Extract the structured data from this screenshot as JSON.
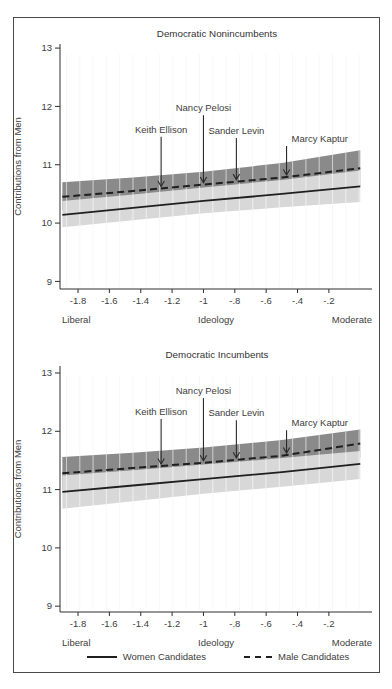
{
  "figure": {
    "background": "#ffffff",
    "border_color": "#4a4a4a",
    "text_color": "#3d3d3d",
    "line_color": "#1f1f1f",
    "band_colors": {
      "male": "#8a8a8a",
      "women": "#d8d8d8"
    },
    "legend": {
      "items": [
        {
          "label": "Women Candidates",
          "style": "solid"
        },
        {
          "label": "Male Candidates",
          "style": "dashed"
        }
      ]
    }
  },
  "chart_data": [
    {
      "type": "area",
      "title": "Democratic Nonincumbents",
      "xlabel": "Ideology",
      "ylabel": "Contributions from Men",
      "x_axis_end_labels": {
        "left": "Liberal",
        "right": "Moderate"
      },
      "xlim": [
        -1.915,
        0.075
      ],
      "ylim": [
        8.87,
        13.07
      ],
      "x_ticks": {
        "values": [
          -1.8,
          -1.6,
          -1.4,
          -1.2,
          -1.0,
          -0.8,
          -0.6,
          -0.4,
          -0.2
        ],
        "labels": [
          "-1.8",
          "-1.6",
          "-1.4",
          "-1.2",
          "-1",
          "-.8",
          "-.6",
          "-.4",
          "-.2"
        ]
      },
      "y_ticks": {
        "values": [
          9,
          10,
          11,
          12,
          13
        ],
        "labels": [
          "9",
          "10",
          "11",
          "12",
          "13"
        ]
      },
      "hatch": true,
      "x": [
        -1.9,
        -1.45,
        -1.0,
        -0.5,
        0.0
      ],
      "series": [
        {
          "name": "Male Candidates",
          "line_style": "dashed",
          "color": "#1f1f1f",
          "band_color": "#8a8a8a",
          "line": [
            10.45,
            10.55,
            10.66,
            10.78,
            10.94
          ],
          "band_hi": [
            10.7,
            10.78,
            10.88,
            11.03,
            11.25
          ],
          "band_lo": [
            10.22,
            10.33,
            10.44,
            10.53,
            10.63
          ]
        },
        {
          "name": "Women Candidates",
          "line_style": "solid",
          "color": "#1f1f1f",
          "band_color": "#d8d8d8",
          "line": [
            10.14,
            10.26,
            10.38,
            10.5,
            10.63
          ],
          "band_hi": [
            10.38,
            10.49,
            10.61,
            10.74,
            10.9
          ],
          "band_lo": [
            9.93,
            10.05,
            10.17,
            10.27,
            10.36
          ]
        }
      ],
      "annotations": [
        {
          "label": "Keith Ellison",
          "x": -1.27,
          "label_y": 11.6,
          "align": "center"
        },
        {
          "label": "Nancy Pelosi",
          "x": -1.0,
          "label_y": 11.97,
          "align": "center"
        },
        {
          "label": "Sander Levin",
          "x": -0.79,
          "label_y": 11.58,
          "align": "center"
        },
        {
          "label": "Marcy Kaptur",
          "x": -0.47,
          "label_y": 11.44,
          "align": "right-of-arrow"
        }
      ]
    },
    {
      "type": "area",
      "title": "Democratic Incumbents",
      "xlabel": "Ideology",
      "ylabel": "Contributions from Men",
      "x_axis_end_labels": {
        "left": "Liberal",
        "right": "Moderate"
      },
      "xlim": [
        -1.915,
        0.075
      ],
      "ylim": [
        8.9,
        13.12
      ],
      "x_ticks": {
        "values": [
          -1.8,
          -1.6,
          -1.4,
          -1.2,
          -1.0,
          -0.8,
          -0.6,
          -0.4,
          -0.2
        ],
        "labels": [
          "-1.8",
          "-1.6",
          "-1.4",
          "-1.2",
          "-1",
          "-.8",
          "-.6",
          "-.4",
          "-.2"
        ]
      },
      "y_ticks": {
        "values": [
          9,
          10,
          11,
          12,
          13
        ],
        "labels": [
          "9",
          "10",
          "11",
          "12",
          "13"
        ]
      },
      "hatch": true,
      "x": [
        -1.9,
        -1.45,
        -1.0,
        -0.5,
        0.0
      ],
      "series": [
        {
          "name": "Male Candidates",
          "line_style": "dashed",
          "color": "#1f1f1f",
          "band_color": "#8a8a8a",
          "line": [
            11.28,
            11.37,
            11.46,
            11.58,
            11.79
          ],
          "band_hi": [
            11.56,
            11.63,
            11.72,
            11.85,
            12.03
          ],
          "band_lo": [
            11.0,
            11.1,
            11.2,
            11.32,
            11.55
          ]
        },
        {
          "name": "Women Candidates",
          "line_style": "solid",
          "color": "#1f1f1f",
          "band_color": "#d8d8d8",
          "line": [
            10.96,
            11.07,
            11.18,
            11.3,
            11.44
          ],
          "band_hi": [
            11.24,
            11.33,
            11.43,
            11.54,
            11.66
          ],
          "band_lo": [
            10.67,
            10.8,
            10.93,
            11.05,
            11.18
          ]
        }
      ],
      "annotations": [
        {
          "label": "Keith Ellison",
          "x": -1.27,
          "label_y": 12.33,
          "align": "center"
        },
        {
          "label": "Nancy Pelosi",
          "x": -1.0,
          "label_y": 12.69,
          "align": "center"
        },
        {
          "label": "Sander Levin",
          "x": -0.79,
          "label_y": 12.31,
          "align": "center"
        },
        {
          "label": "Marcy Kaptur",
          "x": -0.47,
          "label_y": 12.14,
          "align": "right-of-arrow"
        }
      ]
    }
  ]
}
